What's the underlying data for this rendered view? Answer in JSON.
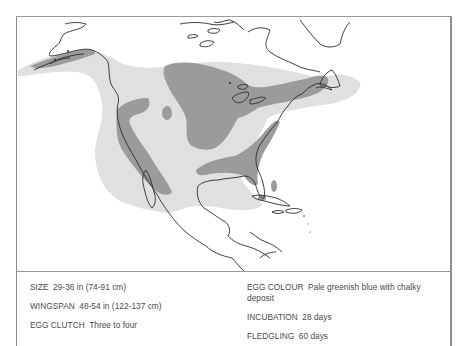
{
  "map": {
    "title": "Breeding and winter range map — North America",
    "colors": {
      "background": "#ffffff",
      "outer_range": "#e0e0e0",
      "core_range": "#9b9b9b",
      "coastline": "#2a2a2a",
      "frame": "#8c8c8c"
    },
    "regions": [
      "Alaska",
      "Canada",
      "United States",
      "Mexico",
      "Cuba",
      "Caribbean",
      "Newfoundland",
      "Great Lakes"
    ]
  },
  "facts": {
    "left": [
      {
        "label": "SIZE",
        "value": "29-36 in (74-91 cm)"
      },
      {
        "label": "WINGSPAN",
        "value": "48-54 in (122-137 cm)"
      },
      {
        "label": "EGG CLUTCH",
        "value": "Three to four"
      }
    ],
    "right": [
      {
        "label": "EGG COLOUR",
        "value": "Pale greenish blue with chalky deposit"
      },
      {
        "label": "INCUBATION",
        "value": "28 days"
      },
      {
        "label": "FLEDGLING",
        "value": "60 days"
      }
    ]
  }
}
